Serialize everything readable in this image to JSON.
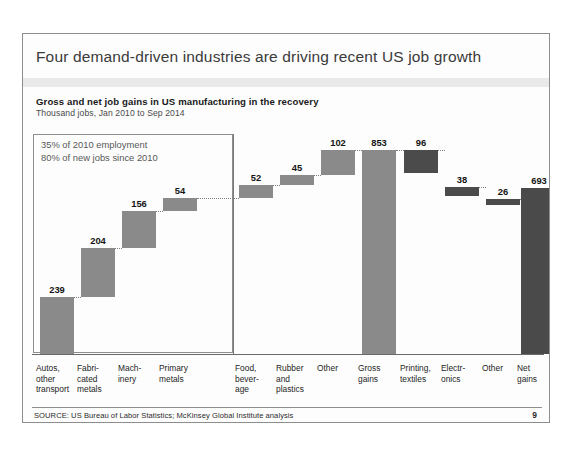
{
  "slide": {
    "title": "Four demand-driven industries are driving recent US job growth",
    "subtitle": "Gross and net job gains in US manufacturing in the recovery",
    "units": "Thousand jobs, Jan 2010 to Sep 2014",
    "annotation": "35% of 2010 employment\n80% of new jobs since 2010",
    "source": "SOURCE: US Bureau of Labor Statistics; McKinsey Global Institute analysis",
    "page_number": "9"
  },
  "colors": {
    "gain_bar": "#8a8a8a",
    "total_bar": "#8a8a8a",
    "loss_bar": "#4b4b4b",
    "net_bar": "#4a4a4a",
    "title_text": "#3a3a3a",
    "band": "#e9e9e9",
    "border": "#8e8e8e"
  },
  "chart_data": {
    "type": "bar",
    "subtype": "waterfall",
    "title": "Gross and net job gains in US manufacturing in the recovery",
    "xlabel": "",
    "ylabel": "Thousand jobs",
    "ylim": [
      0,
      853
    ],
    "grid": false,
    "legend": false,
    "categories": [
      "Autos, other transport",
      "Fabricated metals",
      "Machinery",
      "Primary metals",
      "Food, beverage",
      "Rubber and plastics",
      "Other",
      "Gross gains",
      "Printing, textiles",
      "Electronics",
      "Other",
      "Net gains"
    ],
    "category_label_lines": [
      "Autos,\nother\ntransport",
      "Fabri-\ncated\nmetals",
      "Mach-\ninery",
      "Primary\nmetals",
      "Food,\nbever-\nage",
      "Rubber\nand\nplastics",
      "Other",
      "Gross\ngains",
      "Printing,\ntextiles",
      "Electr-\nonics",
      "Other",
      "Net\ngains"
    ],
    "values": [
      239,
      204,
      156,
      54,
      52,
      45,
      102,
      853,
      96,
      38,
      26,
      693
    ],
    "kinds": [
      "gain",
      "gain",
      "gain",
      "gain",
      "gain",
      "gain",
      "gain",
      "total",
      "loss",
      "loss",
      "loss",
      "net"
    ],
    "cumulative_start": [
      0,
      239,
      443,
      599,
      653,
      705,
      750,
      0,
      757,
      661,
      623,
      0
    ],
    "cumulative_end": [
      239,
      443,
      599,
      653,
      705,
      750,
      852,
      853,
      853,
      699,
      649,
      693
    ],
    "bars": [
      {
        "label": "239",
        "value": 239,
        "kind": "gain",
        "base": 0,
        "top": 239
      },
      {
        "label": "204",
        "value": 204,
        "kind": "gain",
        "base": 239,
        "top": 443
      },
      {
        "label": "156",
        "value": 156,
        "kind": "gain",
        "base": 443,
        "top": 599
      },
      {
        "label": "54",
        "value": 54,
        "kind": "gain",
        "base": 599,
        "top": 653
      },
      {
        "label": "52",
        "value": 52,
        "kind": "gain",
        "base": 653,
        "top": 705
      },
      {
        "label": "45",
        "value": 45,
        "kind": "gain",
        "base": 705,
        "top": 750
      },
      {
        "label": "102",
        "value": 102,
        "kind": "gain",
        "base": 750,
        "top": 852
      },
      {
        "label": "853",
        "value": 853,
        "kind": "total",
        "base": 0,
        "top": 853
      },
      {
        "label": "96",
        "value": 96,
        "kind": "loss",
        "base": 757,
        "top": 853
      },
      {
        "label": "38",
        "value": 38,
        "kind": "loss",
        "base": 661,
        "top": 699
      },
      {
        "label": "26",
        "value": 26,
        "kind": "loss",
        "base": 623,
        "top": 649
      },
      {
        "label": "693",
        "value": 693,
        "kind": "net",
        "base": 0,
        "top": 693
      }
    ],
    "annotations": [
      "35% of 2010 employment",
      "80% of new jobs since 2010"
    ]
  }
}
